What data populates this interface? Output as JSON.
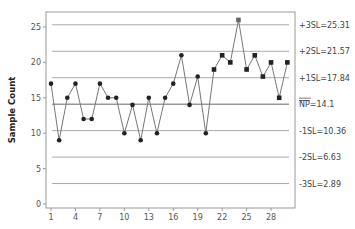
{
  "chart_data": {
    "type": "line",
    "title": "",
    "xlabel": "",
    "ylabel": "Sample Count",
    "ylim": [
      0,
      27
    ],
    "yticks": [
      0,
      5,
      10,
      15,
      20,
      25
    ],
    "xticks": [
      1,
      4,
      7,
      10,
      13,
      16,
      19,
      22,
      25,
      28
    ],
    "x": [
      1,
      2,
      3,
      4,
      5,
      6,
      7,
      8,
      9,
      10,
      11,
      12,
      13,
      14,
      15,
      16,
      17,
      18,
      19,
      20,
      21,
      22,
      23,
      24,
      25,
      26,
      27,
      28,
      29,
      30
    ],
    "series": [
      {
        "name": "Sample Count",
        "values": [
          17,
          9,
          15,
          17,
          12,
          12,
          17,
          15,
          15,
          10,
          14,
          9,
          15,
          10,
          15,
          17,
          21,
          14,
          18,
          10,
          19,
          21,
          20,
          26,
          19,
          21,
          18,
          20,
          15,
          20
        ],
        "square_markers_from": 21
      }
    ],
    "control_lines": [
      {
        "label": "+3SL=25.31",
        "value": 25.31
      },
      {
        "label": "+2SL=21.57",
        "value": 21.57
      },
      {
        "label": "+1SL=17.84",
        "value": 17.84
      },
      {
        "label": "NP=14.1",
        "value": 14.1,
        "overline": "NP",
        "suffix": "=14.1"
      },
      {
        "label": "-1SL=10.36",
        "value": 10.36
      },
      {
        "label": "-2SL=6.63",
        "value": 6.63
      },
      {
        "label": "-3SL=2.89",
        "value": 2.89
      }
    ],
    "grid": false,
    "legend": "none"
  },
  "colors": {
    "line": "#777777",
    "marker": "#222222",
    "control_line": "#aaaaaa",
    "center_line": "#666666",
    "frame": "#999999",
    "highlight_marker": "#666666"
  }
}
